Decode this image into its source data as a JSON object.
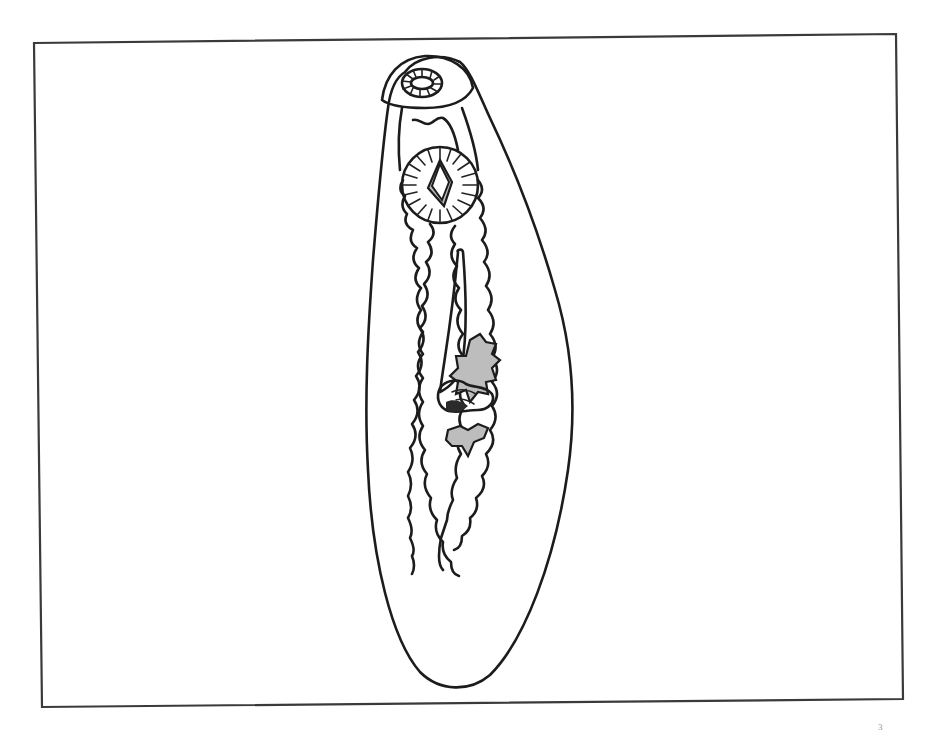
{
  "figure": {
    "frame": {
      "corners": {
        "top_left": [
          34,
          43
        ],
        "top_right": [
          896,
          34
        ],
        "bottom_right": [
          903,
          699
        ],
        "bottom_left": [
          42,
          707
        ]
      },
      "stroke_color": "#3a3a3a"
    },
    "structures": [
      {
        "name": "oral-sucker",
        "center": [
          422,
          83
        ]
      },
      {
        "name": "pharynx-region",
        "center": [
          430,
          120
        ]
      },
      {
        "name": "ventral-sucker-acetabulum",
        "center": [
          440,
          185
        ]
      },
      {
        "name": "cirrus-sac",
        "center": [
          463,
          310
        ]
      },
      {
        "name": "genital-complex",
        "center": [
          468,
          390
        ]
      },
      {
        "name": "left-intestinal-cecum"
      },
      {
        "name": "right-intestinal-cecum"
      },
      {
        "name": "body-outline"
      }
    ],
    "colors": {
      "ink": "#1c1c1c",
      "stipple": "#bdbdbd",
      "background": "#ffffff"
    }
  },
  "caption_fragment": "3"
}
